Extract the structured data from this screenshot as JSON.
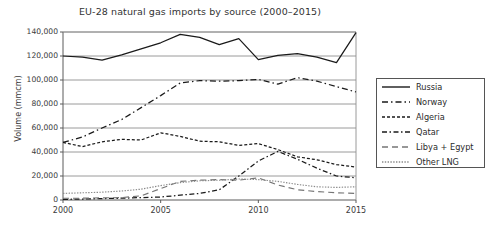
{
  "chart_data": {
    "type": "line",
    "title": "EU-28 natural gas imports by source (2000–2015)",
    "xlabel": "",
    "ylabel": "Volume (mmcm)",
    "xlim": [
      2000,
      2015
    ],
    "ylim": [
      0,
      140000
    ],
    "grid": true,
    "legend_position": "right",
    "x": [
      2000,
      2001,
      2002,
      2003,
      2004,
      2005,
      2006,
      2007,
      2008,
      2009,
      2010,
      2011,
      2012,
      2013,
      2014,
      2015
    ],
    "xticks": [
      "2000",
      "2005",
      "2010",
      "2015"
    ],
    "yticks": [
      "0",
      "20,000",
      "40,000",
      "60,000",
      "80,000",
      "100,000",
      "120,000",
      "140,000"
    ],
    "series": [
      {
        "name": "Russia",
        "style": "solid",
        "values": [
          120000,
          119000,
          116500,
          121000,
          126000,
          131000,
          138000,
          135500,
          129500,
          134500,
          117000,
          120500,
          122000,
          119000,
          114500,
          139500
        ]
      },
      {
        "name": "Norway",
        "style": "dash-dot",
        "values": [
          48000,
          52500,
          60000,
          67000,
          77000,
          87000,
          97500,
          99500,
          99000,
          99500,
          100500,
          96500,
          102000,
          99000,
          94500,
          90000
        ]
      },
      {
        "name": "Algeria",
        "style": "dashed-short",
        "values": [
          48000,
          44500,
          48500,
          50500,
          50000,
          56000,
          53000,
          49000,
          48500,
          45500,
          47000,
          42000,
          36000,
          33500,
          29500,
          27500
        ]
      },
      {
        "name": "Qatar",
        "style": "dash-dot-long",
        "values": [
          500,
          800,
          1200,
          1500,
          2000,
          2500,
          4000,
          5500,
          8500,
          20000,
          32500,
          40500,
          34000,
          26500,
          20000,
          18500
        ]
      },
      {
        "name": "Libya + Egypt",
        "style": "dashed-long",
        "values": [
          1500,
          1500,
          1800,
          2000,
          3500,
          9500,
          15500,
          16500,
          17000,
          16500,
          18500,
          12500,
          8500,
          7000,
          6000,
          5500
        ]
      },
      {
        "name": "Other LNG",
        "style": "dotted",
        "values": [
          5500,
          6000,
          6500,
          7500,
          9000,
          12000,
          14500,
          16000,
          16500,
          17500,
          17000,
          15500,
          13000,
          11000,
          10500,
          11000
        ]
      }
    ]
  },
  "legend": {
    "entries": [
      {
        "label": "Russia"
      },
      {
        "label": "Norway"
      },
      {
        "label": "Algeria"
      },
      {
        "label": "Qatar"
      },
      {
        "label": "Libya + Egypt"
      },
      {
        "label": "Other LNG"
      }
    ]
  },
  "colors": {
    "line": "#1a1a1a",
    "grid": "#8e8e8e",
    "frame": "#5a5a5a",
    "text": "#3a3a3a",
    "background": "#ffffff"
  }
}
